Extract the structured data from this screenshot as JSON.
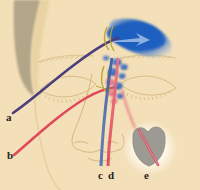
{
  "figure": {
    "background_color": "#f6e2bd",
    "type": "anatomical-illustration"
  },
  "palette": {
    "skin": "#f3dfb8",
    "skin_shadow": "#e7cf9f",
    "hair_shadow": "#9c9278",
    "vessel_purple": "#4a3f7d",
    "vessel_red": "#e0495a",
    "vessel_blue": "#2f5fb8",
    "arrow_blue": "#1f5fbf",
    "node_blue": "#3d6fc4",
    "node_pink": "#e8737f",
    "duct_yellow": "#b8a430",
    "inset_gray": "#9c9a93",
    "inset_halo": "#fdf6e6",
    "outline": "#c9a86b",
    "label_text": "#231f1c"
  },
  "labels": [
    {
      "id": "a",
      "text": "a",
      "x": 6,
      "y": 112,
      "target": "purple-vessel-terminus"
    },
    {
      "id": "b",
      "text": "b",
      "x": 7,
      "y": 150,
      "target": "red-vessel-terminus"
    },
    {
      "id": "c",
      "text": "c",
      "x": 98,
      "y": 170,
      "target": "blue-vertical-vessel"
    },
    {
      "id": "d",
      "text": "d",
      "x": 108,
      "y": 170,
      "target": "red-vertical-vessel"
    },
    {
      "id": "e",
      "text": "e",
      "x": 144,
      "y": 170,
      "target": "inset-detail-vessel"
    }
  ],
  "features": {
    "arrow": {
      "name": "blue-flow-arrow",
      "color": "#1f5fbf",
      "direction": "right"
    },
    "nodes": {
      "name": "lymph-node-cluster",
      "count": 9,
      "colors": [
        "#3d6fc4",
        "#e8737f"
      ]
    },
    "inset": {
      "name": "inset-detail",
      "shape": "lobe",
      "fill": "#9c9a93"
    },
    "eyes": {
      "left": "left-eye",
      "right": "right-eye"
    },
    "brows": {
      "left": "left-eyebrow",
      "right": "right-eyebrow"
    },
    "nose": "nose-outline"
  }
}
